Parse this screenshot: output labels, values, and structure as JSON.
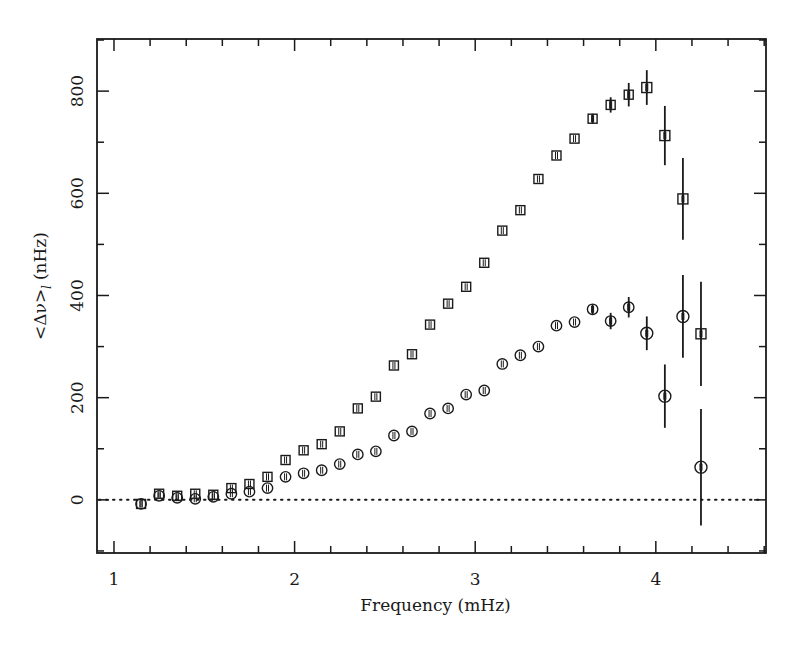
{
  "chart_data": {
    "type": "scatter",
    "title": "",
    "xlabel": "Frequency (mHz)",
    "ylabel": "<Δν>",
    "ylabel_subscript": "l",
    "ylabel_units": "(nHz)",
    "xlim": [
      0.906,
      4.61
    ],
    "ylim": [
      -104,
      902
    ],
    "xticks_major": [
      1,
      2,
      3,
      4
    ],
    "xtick_labels": [
      "1",
      "2",
      "3",
      "4"
    ],
    "xticks_minor_step": 0.2,
    "yticks_major": [
      0,
      200,
      400,
      600,
      800
    ],
    "ytick_labels": [
      "0",
      "200",
      "400",
      "600",
      "800"
    ],
    "yticks_minor_step": 100,
    "grid": false,
    "legend": null,
    "reference_line": {
      "y": 0,
      "style": "dotted"
    },
    "series": [
      {
        "name": "squares",
        "marker": "square",
        "points": [
          {
            "x": 1.15,
            "y": -8,
            "err": 0
          },
          {
            "x": 1.25,
            "y": 12,
            "err": 0
          },
          {
            "x": 1.35,
            "y": 8,
            "err": 0
          },
          {
            "x": 1.45,
            "y": 12,
            "err": 0
          },
          {
            "x": 1.55,
            "y": 10,
            "err": 0
          },
          {
            "x": 1.65,
            "y": 23,
            "err": 0
          },
          {
            "x": 1.75,
            "y": 31,
            "err": 0
          },
          {
            "x": 1.85,
            "y": 45,
            "err": 0
          },
          {
            "x": 1.95,
            "y": 78,
            "err": 0
          },
          {
            "x": 2.05,
            "y": 97,
            "err": 0
          },
          {
            "x": 2.15,
            "y": 109,
            "err": 0
          },
          {
            "x": 2.25,
            "y": 134,
            "err": 0
          },
          {
            "x": 2.35,
            "y": 179,
            "err": 0
          },
          {
            "x": 2.45,
            "y": 202,
            "err": 0
          },
          {
            "x": 2.55,
            "y": 263,
            "err": 0
          },
          {
            "x": 2.65,
            "y": 285,
            "err": 0
          },
          {
            "x": 2.75,
            "y": 343,
            "err": 0
          },
          {
            "x": 2.85,
            "y": 384,
            "err": 0
          },
          {
            "x": 2.95,
            "y": 417,
            "err": 0
          },
          {
            "x": 3.05,
            "y": 464,
            "err": 0
          },
          {
            "x": 3.15,
            "y": 527,
            "err": 0
          },
          {
            "x": 3.25,
            "y": 567,
            "err": 0
          },
          {
            "x": 3.35,
            "y": 628,
            "err": 0
          },
          {
            "x": 3.45,
            "y": 674,
            "err": 0
          },
          {
            "x": 3.55,
            "y": 707,
            "err": 0
          },
          {
            "x": 3.65,
            "y": 746,
            "err": 6
          },
          {
            "x": 3.75,
            "y": 773,
            "err": 15
          },
          {
            "x": 3.85,
            "y": 793,
            "err": 23
          },
          {
            "x": 3.95,
            "y": 807,
            "err": 34
          },
          {
            "x": 4.05,
            "y": 713,
            "err": 58
          },
          {
            "x": 4.15,
            "y": 589,
            "err": 80
          },
          {
            "x": 4.25,
            "y": 325,
            "err": 102
          }
        ]
      },
      {
        "name": "circles",
        "marker": "circle",
        "points": [
          {
            "x": 1.15,
            "y": -8,
            "err": 0
          },
          {
            "x": 1.25,
            "y": 8,
            "err": 0
          },
          {
            "x": 1.35,
            "y": 4,
            "err": 0
          },
          {
            "x": 1.45,
            "y": 2,
            "err": 0
          },
          {
            "x": 1.55,
            "y": 6,
            "err": 0
          },
          {
            "x": 1.65,
            "y": 12,
            "err": 0
          },
          {
            "x": 1.75,
            "y": 16,
            "err": 0
          },
          {
            "x": 1.85,
            "y": 23,
            "err": 0
          },
          {
            "x": 1.95,
            "y": 45,
            "err": 0
          },
          {
            "x": 2.05,
            "y": 52,
            "err": 0
          },
          {
            "x": 2.15,
            "y": 58,
            "err": 0
          },
          {
            "x": 2.25,
            "y": 70,
            "err": 0
          },
          {
            "x": 2.35,
            "y": 89,
            "err": 0
          },
          {
            "x": 2.45,
            "y": 95,
            "err": 0
          },
          {
            "x": 2.55,
            "y": 126,
            "err": 0
          },
          {
            "x": 2.65,
            "y": 134,
            "err": 0
          },
          {
            "x": 2.75,
            "y": 169,
            "err": 0
          },
          {
            "x": 2.85,
            "y": 179,
            "err": 0
          },
          {
            "x": 2.95,
            "y": 206,
            "err": 0
          },
          {
            "x": 3.05,
            "y": 214,
            "err": 0
          },
          {
            "x": 3.15,
            "y": 266,
            "err": 0
          },
          {
            "x": 3.25,
            "y": 283,
            "err": 0
          },
          {
            "x": 3.35,
            "y": 300,
            "err": 0
          },
          {
            "x": 3.45,
            "y": 341,
            "err": 0
          },
          {
            "x": 3.55,
            "y": 348,
            "err": 0
          },
          {
            "x": 3.65,
            "y": 373,
            "err": 6
          },
          {
            "x": 3.75,
            "y": 350,
            "err": 16
          },
          {
            "x": 3.85,
            "y": 377,
            "err": 20
          },
          {
            "x": 3.95,
            "y": 326,
            "err": 33
          },
          {
            "x": 4.05,
            "y": 203,
            "err": 62
          },
          {
            "x": 4.15,
            "y": 359,
            "err": 81
          },
          {
            "x": 4.25,
            "y": 64,
            "err": 114
          }
        ]
      }
    ]
  },
  "layout": {
    "plot_left": 97,
    "plot_top": 39,
    "plot_right": 766,
    "plot_bottom": 553
  },
  "colors": {
    "ink": "#1a1a1a",
    "background": "#ffffff"
  }
}
